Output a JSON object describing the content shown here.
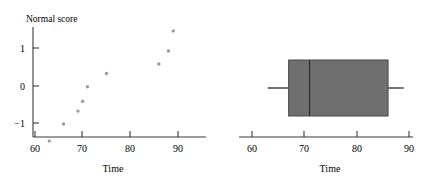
{
  "chart_data": [
    {
      "type": "scatter",
      "title": "Normal score",
      "xlabel": "Time",
      "ylabel": "Normal score",
      "xlim": [
        57,
        93
      ],
      "ylim": [
        -1.9,
        1.8
      ],
      "xticks": [
        60,
        70,
        80,
        90
      ],
      "xtick_labels": [
        "60",
        "70",
        "80",
        "90"
      ],
      "yticks": [
        -1,
        0,
        1
      ],
      "ytick_labels": [
        "−1",
        "0",
        "1"
      ],
      "grid": false,
      "legend": "none",
      "x": [
        63,
        66,
        69,
        70,
        71,
        75,
        86,
        88,
        89
      ],
      "y": [
        -1.45,
        -1.0,
        -0.66,
        -0.4,
        -0.02,
        0.33,
        0.58,
        0.92,
        1.45
      ],
      "points": [
        {
          "x": 63,
          "y": -1.45
        },
        {
          "x": 66,
          "y": -1.0
        },
        {
          "x": 69,
          "y": -0.66
        },
        {
          "x": 70,
          "y": -0.4
        },
        {
          "x": 71,
          "y": -0.02
        },
        {
          "x": 75,
          "y": 0.33
        },
        {
          "x": 86,
          "y": 0.58
        },
        {
          "x": 88,
          "y": 0.92
        },
        {
          "x": 89,
          "y": 1.45
        }
      ]
    },
    {
      "type": "box",
      "title": "",
      "xlabel": "Time",
      "ylabel": "",
      "xlim": [
        57,
        93
      ],
      "xticks": [
        60,
        70,
        80,
        90
      ],
      "xtick_labels": [
        "60",
        "70",
        "80",
        "90"
      ],
      "grid": false,
      "legend": "none",
      "orientation": "horizontal",
      "box": {
        "min_whisker": 63,
        "q1": 67,
        "median": 71,
        "q3": 86,
        "max_whisker": 89
      },
      "box_color": "#6f6f6f"
    }
  ],
  "scatter": {
    "y_axis_title": "Normal score",
    "x_axis_title": "Time",
    "ytick_labels": [
      "1",
      "0",
      "−1"
    ],
    "xtick_labels": [
      "60",
      "70",
      "80",
      "90"
    ]
  },
  "boxplot": {
    "x_axis_title": "Time",
    "xtick_labels": [
      "60",
      "70",
      "80",
      "90"
    ]
  },
  "colors": {
    "point": "#9a9a9a",
    "box_fill": "#6f6f6f",
    "axis": "#3a3a3a"
  }
}
